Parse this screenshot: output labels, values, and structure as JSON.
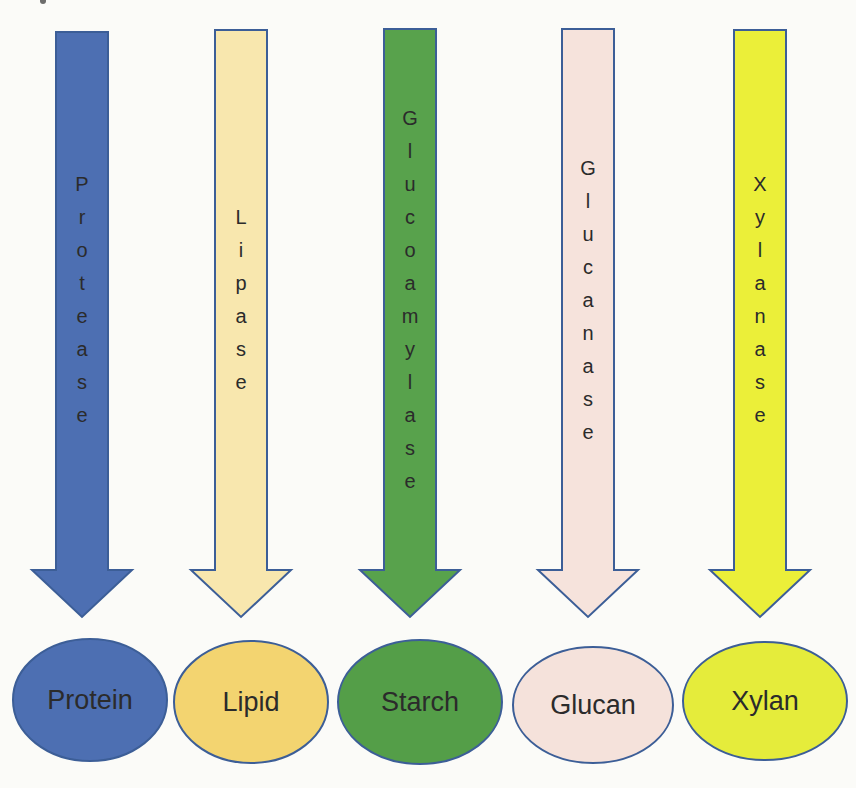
{
  "diagram": {
    "outline_color": "#3C5E97",
    "text_color": "#2B2B2B",
    "background_color": "#FBFBF8",
    "pairs": [
      {
        "enzyme": "Protease",
        "substrate": "Protein",
        "arrow_fill": "#4D6FB2",
        "ellipse_fill": "#4D6FB2"
      },
      {
        "enzyme": "Lipase",
        "substrate": "Lipid",
        "arrow_fill": "#F8E7AE",
        "ellipse_fill": "#F3D470"
      },
      {
        "enzyme": "Glucoamylase",
        "substrate": "Starch",
        "arrow_fill": "#58A24C",
        "ellipse_fill": "#549E48"
      },
      {
        "enzyme": "Glucanase",
        "substrate": "Glucan",
        "arrow_fill": "#F6E3DC",
        "ellipse_fill": "#F5E2DB"
      },
      {
        "enzyme": "Xylanase",
        "substrate": "Xylan",
        "arrow_fill": "#EBEF39",
        "ellipse_fill": "#E5EC3B"
      }
    ]
  }
}
